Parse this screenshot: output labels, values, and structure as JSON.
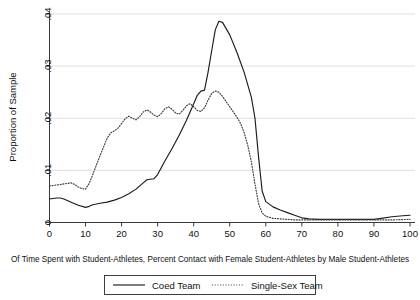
{
  "chart_data": {
    "type": "line",
    "title": "",
    "subtitle": "",
    "xlabel": "Of Time Spent with Student-Athletes, Percent Contact with Female Student-Athletes by Male Student-Athletes",
    "ylabel": "Proportion of Sample",
    "xlim": [
      0,
      100
    ],
    "ylim": [
      0,
      0.04
    ],
    "grid": true,
    "legend_position": "bottom",
    "xticks": [
      0,
      10,
      20,
      30,
      40,
      50,
      60,
      70,
      80,
      90,
      100
    ],
    "xtick_labels": [
      "0",
      "10",
      "20",
      "30",
      "40",
      "50",
      "60",
      "70",
      "80",
      "90",
      "100"
    ],
    "yticks": [
      0,
      0.01,
      0.02,
      0.03,
      0.04
    ],
    "ytick_labels": [
      "0",
      ".01",
      ".02",
      ".03",
      ".04"
    ],
    "series": [
      {
        "name": "Coed Team",
        "style": "solid",
        "color": "#1c1c1c",
        "x": [
          0,
          2,
          3,
          4,
          6,
          8,
          10,
          11,
          12,
          14,
          16,
          18,
          20,
          22,
          24,
          26,
          27,
          28,
          29,
          30,
          31,
          32,
          34,
          36,
          38,
          40,
          41,
          42,
          43,
          44,
          45,
          46,
          47,
          48,
          50,
          52,
          54,
          56,
          57,
          58,
          59,
          60,
          62,
          64,
          66,
          68,
          70,
          72,
          75,
          80,
          85,
          88,
          90,
          92,
          95,
          98,
          100
        ],
        "y": [
          0.0045,
          0.0047,
          0.0047,
          0.0045,
          0.0039,
          0.0033,
          0.0029,
          0.0031,
          0.0034,
          0.0037,
          0.0039,
          0.0043,
          0.0048,
          0.0055,
          0.0064,
          0.0076,
          0.0082,
          0.0083,
          0.0084,
          0.0092,
          0.0105,
          0.0118,
          0.0142,
          0.0168,
          0.0196,
          0.0228,
          0.0244,
          0.0252,
          0.0254,
          0.0289,
          0.033,
          0.037,
          0.0386,
          0.0384,
          0.036,
          0.0326,
          0.0288,
          0.024,
          0.02,
          0.0125,
          0.006,
          0.004,
          0.003,
          0.0024,
          0.0019,
          0.0014,
          0.0009,
          0.0007,
          0.0006,
          0.0006,
          0.0006,
          0.0006,
          0.0006,
          0.0008,
          0.0011,
          0.0013,
          0.0014
        ]
      },
      {
        "name": "Single-Sex Team",
        "style": "dotted",
        "color": "#3c3c3c",
        "x": [
          0,
          2,
          3,
          4,
          5,
          6,
          7,
          8,
          9,
          10,
          11,
          12,
          13,
          14,
          15,
          16,
          17,
          18,
          19,
          20,
          21,
          22,
          23,
          24,
          25,
          26,
          27,
          28,
          29,
          30,
          31,
          32,
          33,
          34,
          35,
          36,
          37,
          38,
          39,
          40,
          41,
          42,
          43,
          44,
          45,
          46,
          47,
          48,
          49,
          50,
          51,
          52,
          53,
          54,
          55,
          56,
          57,
          58,
          59,
          60,
          62,
          64,
          66,
          68,
          70,
          75,
          80,
          85,
          90,
          95,
          100
        ],
        "y": [
          0.007,
          0.0072,
          0.0073,
          0.0074,
          0.0075,
          0.0076,
          0.0073,
          0.0068,
          0.0065,
          0.0064,
          0.0075,
          0.0092,
          0.011,
          0.0128,
          0.0145,
          0.0162,
          0.0172,
          0.0176,
          0.0181,
          0.019,
          0.0199,
          0.0204,
          0.02,
          0.0197,
          0.0203,
          0.0212,
          0.0216,
          0.0212,
          0.0206,
          0.0203,
          0.0209,
          0.0218,
          0.0222,
          0.0217,
          0.021,
          0.0208,
          0.0215,
          0.0224,
          0.0228,
          0.0222,
          0.0215,
          0.0213,
          0.022,
          0.0235,
          0.0248,
          0.0252,
          0.025,
          0.0242,
          0.0232,
          0.0222,
          0.0212,
          0.0202,
          0.019,
          0.0172,
          0.0148,
          0.0116,
          0.0074,
          0.0036,
          0.0018,
          0.0012,
          0.0008,
          0.0007,
          0.0006,
          0.0005,
          0.0005,
          0.0005,
          0.0005,
          0.0005,
          0.0005,
          0.0005,
          0.0006
        ]
      }
    ]
  },
  "axes": {
    "ylabel": "Proportion of Sample",
    "ytick_labels": [
      "0",
      ".01",
      ".02",
      ".03",
      ".04"
    ],
    "xtick_labels": [
      "0",
      "10",
      "20",
      "30",
      "40",
      "50",
      "60",
      "70",
      "80",
      "90",
      "100"
    ]
  },
  "caption": {
    "text": "Of Time Spent with Student-Athletes, Percent Contact with Female Student-Athletes by Male Student-Athletes"
  },
  "legend": {
    "items": [
      {
        "label": "Coed Team",
        "style": "solid"
      },
      {
        "label": "Single-Sex Team",
        "style": "dotted"
      }
    ]
  }
}
